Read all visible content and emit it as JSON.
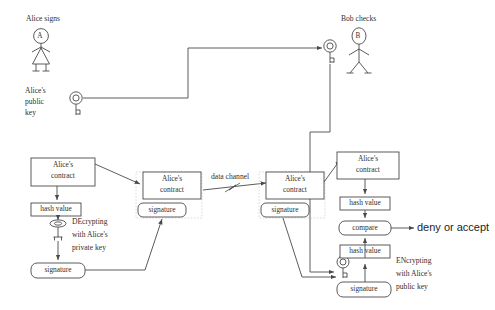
{
  "diagram": {
    "title_alice": "Alice signs",
    "title_bob": "Bob checks",
    "alice_head_letter": "A",
    "bob_head_letter": "B",
    "alice_public_key_label_l1": "Alice's",
    "alice_public_key_label_l2": "public",
    "alice_public_key_label_l3": "key",
    "data_channel_label": "data channel",
    "decrypt_note_l1": "DEcrypting",
    "decrypt_note_l2": "with Alice's",
    "decrypt_note_l3": "private key",
    "encrypt_note_l1": "ENcrypting",
    "encrypt_note_l2": "with Alice's",
    "encrypt_note_l3": "public key",
    "outcome_label": "deny or accept",
    "stroke_color": "#4a4a4a",
    "text_color": "#2f2f2f",
    "background": "#ffffff"
  },
  "boxes": {
    "contract_left_l1": "Alice's",
    "contract_left_l2": "contract",
    "hash_left": "hash value",
    "signature_left": "signature",
    "contract_mid_l1": "Alice's",
    "contract_mid_l2": "contract",
    "signature_mid": "signature",
    "contract_mid2_l1": "Alice's",
    "contract_mid2_l2": "contract",
    "signature_mid2": "signature",
    "contract_right_l1": "Alice's",
    "contract_right_l2": "contract",
    "hash_right_top": "hash value",
    "compare": "compare",
    "hash_right_bottom": "hash value",
    "signature_right": "signature"
  },
  "icons": {
    "public_key_left": "key-icon",
    "public_key_bob": "key-icon",
    "private_key": "private-key-icon",
    "public_key_right": "key-icon",
    "alice_figure": "person-icon",
    "bob_figure": "person-icon",
    "channel_mark": "zigzag-icon"
  }
}
